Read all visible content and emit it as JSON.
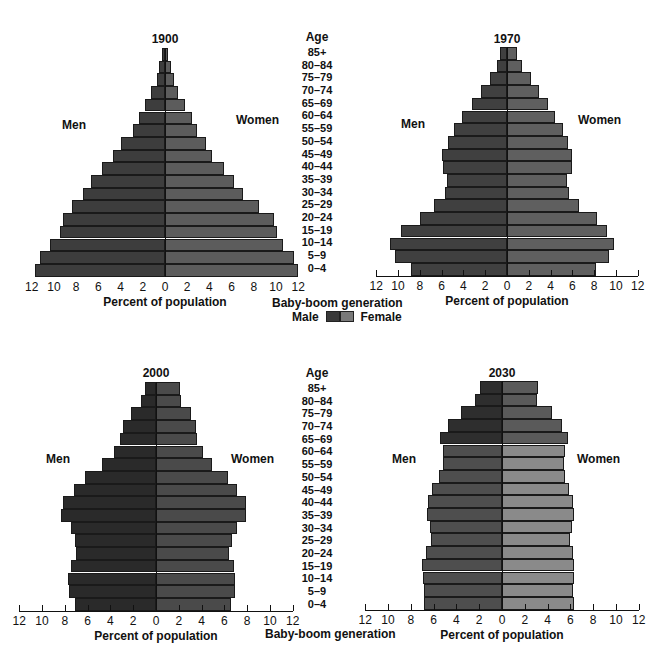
{
  "chart_data": [
    {
      "type": "bar",
      "subtype": "population-pyramid",
      "title": "1900",
      "categories": [
        "85+",
        "80-84",
        "75-79",
        "70-74",
        "65-69",
        "60-64",
        "55-59",
        "50-54",
        "45-49",
        "40-44",
        "35-39",
        "30-34",
        "25-29",
        "20-24",
        "15-19",
        "10-14",
        "5-9",
        "0-4"
      ],
      "series": [
        {
          "name": "Men",
          "values": [
            0.3,
            0.5,
            0.7,
            1.3,
            1.8,
            2.3,
            2.9,
            4.0,
            4.7,
            5.7,
            6.7,
            7.4,
            8.4,
            9.2,
            9.5,
            10.4,
            11.3,
            11.7
          ]
        },
        {
          "name": "Women",
          "values": [
            0.3,
            0.5,
            0.8,
            1.2,
            1.8,
            2.4,
            2.9,
            3.7,
            4.2,
            5.3,
            6.2,
            7.0,
            8.5,
            9.8,
            10.1,
            10.6,
            11.6,
            12.0
          ]
        }
      ],
      "xlabel": "Percent of population",
      "ylabel": "Age",
      "xlim": [
        -12,
        12
      ],
      "xticks": [
        12,
        10,
        8,
        6,
        4,
        2,
        0,
        2,
        4,
        6,
        8,
        10,
        12
      ],
      "side_labels": [
        "Men",
        "Women"
      ],
      "baby_boom_rows": []
    },
    {
      "type": "bar",
      "subtype": "population-pyramid",
      "title": "1970",
      "categories": [
        "85+",
        "80-84",
        "75-79",
        "70-74",
        "65-69",
        "60-64",
        "55-59",
        "50-54",
        "45-49",
        "40-44",
        "35-39",
        "30-34",
        "25-29",
        "20-24",
        "15-19",
        "10-14",
        "5-9",
        "0-4"
      ],
      "series": [
        {
          "name": "Men",
          "values": [
            0.6,
            0.9,
            1.6,
            2.4,
            3.2,
            4.1,
            4.9,
            5.4,
            6.0,
            5.9,
            5.5,
            5.7,
            6.7,
            8.0,
            9.7,
            10.7,
            10.3,
            8.8
          ]
        },
        {
          "name": "Women",
          "values": [
            0.9,
            1.4,
            2.2,
            2.9,
            3.8,
            4.4,
            5.1,
            5.6,
            6.0,
            6.0,
            5.5,
            5.7,
            6.6,
            8.3,
            9.2,
            9.8,
            9.4,
            8.2
          ]
        }
      ],
      "xlabel": "Percent of population",
      "ylabel": "Age",
      "xlim": [
        -12,
        12
      ],
      "xticks": [
        12,
        10,
        8,
        6,
        4,
        2,
        0,
        2,
        4,
        6,
        8,
        10,
        12
      ],
      "side_labels": [
        "Men",
        "Women"
      ],
      "baby_boom_rows": []
    },
    {
      "type": "bar",
      "subtype": "population-pyramid",
      "title": "2000",
      "categories": [
        "85+",
        "80-84",
        "75-79",
        "70-74",
        "65-69",
        "60-64",
        "55-59",
        "50-54",
        "45-49",
        "40-44",
        "35-39",
        "30-34",
        "25-29",
        "20-24",
        "15-19",
        "10-14",
        "5-9",
        "0-4"
      ],
      "series": [
        {
          "name": "Men",
          "values": [
            1.0,
            1.3,
            2.2,
            2.9,
            3.2,
            3.7,
            4.7,
            6.2,
            7.2,
            8.2,
            8.3,
            7.5,
            7.1,
            7.0,
            7.5,
            7.7,
            7.6,
            7.1
          ]
        },
        {
          "name": "Women",
          "values": [
            2.1,
            2.2,
            3.1,
            3.5,
            3.6,
            4.1,
            4.9,
            6.3,
            7.1,
            7.9,
            7.9,
            7.1,
            6.7,
            6.4,
            6.8,
            6.9,
            6.9,
            6.6
          ]
        }
      ],
      "xlabel": "Percent of population",
      "ylabel": "Age",
      "xlim": [
        -12,
        12
      ],
      "xticks": [
        12,
        10,
        8,
        6,
        4,
        2,
        0,
        2,
        4,
        6,
        8,
        10,
        12
      ],
      "side_labels": [
        "Men",
        "Women"
      ],
      "baby_boom_rows": [
        "55-59",
        "50-54",
        "45-49",
        "40-44",
        "35-39"
      ]
    },
    {
      "type": "bar",
      "subtype": "population-pyramid",
      "title": "2030",
      "categories": [
        "85+",
        "80-84",
        "75-79",
        "70-74",
        "65-69",
        "60-64",
        "55-59",
        "50-54",
        "45-49",
        "40-44",
        "35-39",
        "30-34",
        "25-29",
        "20-24",
        "15-19",
        "10-14",
        "5-9",
        "0-4"
      ],
      "series": [
        {
          "name": "Men",
          "values": [
            1.9,
            2.4,
            3.6,
            4.7,
            5.4,
            5.2,
            5.2,
            5.5,
            6.1,
            6.5,
            6.6,
            6.3,
            6.2,
            6.7,
            7.0,
            6.9,
            6.8,
            6.8
          ]
        },
        {
          "name": "Women",
          "values": [
            3.2,
            3.1,
            4.4,
            5.3,
            5.8,
            5.5,
            5.4,
            5.5,
            5.9,
            6.2,
            6.3,
            6.1,
            6.0,
            6.2,
            6.3,
            6.3,
            6.2,
            6.3
          ]
        }
      ],
      "xlabel": "Percent of population",
      "ylabel": "Age",
      "xlim": [
        -12,
        12
      ],
      "xticks": [
        12,
        10,
        8,
        6,
        4,
        2,
        0,
        2,
        4,
        6,
        8,
        10,
        12
      ],
      "side_labels": [
        "Men",
        "Women"
      ],
      "baby_boom_rows": [
        "85+",
        "80-84",
        "75-79",
        "70-74",
        "65-69"
      ]
    }
  ],
  "age_column": {
    "header": "Age",
    "labels": [
      "85+",
      "80–84",
      "75–79",
      "70–74",
      "65–69",
      "60–64",
      "55–59",
      "50–54",
      "45–49",
      "40–44",
      "35–39",
      "30–34",
      "25–29",
      "20–24",
      "15–19",
      "10–14",
      "5–9",
      "0–4"
    ]
  },
  "legend": {
    "title": "Baby-boom generation",
    "male_label": "Male",
    "female_label": "Female"
  },
  "labels": {
    "men": "Men",
    "women": "Women",
    "xlabel": "Percent of population"
  },
  "colors": {
    "p1900": {
      "men": "#3d3d3d",
      "women": "#5c5c5c"
    },
    "p1970": {
      "men": "#404040",
      "women": "#5f5f5f"
    },
    "p2000": {
      "men": "#2a2a2a",
      "women": "#4a4a4a"
    },
    "p2030": {
      "men": "#4e4e4e",
      "women": "#8a8a8a"
    },
    "baby_boom_2030": {
      "men": "#2e2e2e",
      "women": "#5a5a5a"
    },
    "legend_male": "#3a3a3a",
    "legend_female": "#7a7a7a"
  }
}
